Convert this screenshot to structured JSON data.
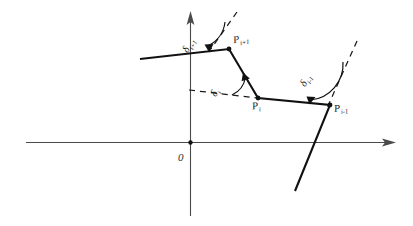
{
  "figure": {
    "background_color": "#ffffff",
    "ink_color": "#111111",
    "axis_color": "#4a4a4a",
    "origin_label": "0",
    "axes": {
      "x_axis_name": "x-axis",
      "y_axis_name": "y-axis",
      "x_arrow": "right-arrowhead",
      "y_arrow": "up-arrowhead"
    },
    "vertices": [
      {
        "id": "p-i-plus-1",
        "label_base": "P",
        "label_sub": "i+1",
        "x": 229,
        "y": 49
      },
      {
        "id": "p-i",
        "label_base": "P",
        "label_sub": "i",
        "x": 258,
        "y": 98
      },
      {
        "id": "p-i-minus-1",
        "label_base": "P",
        "label_sub": "i-1",
        "x": 330,
        "y": 105
      }
    ],
    "angles": [
      {
        "id": "delta-i-plus-1",
        "label_base": "δ",
        "label_sub": "i+1",
        "at_vertex": "p-i-plus-1"
      },
      {
        "id": "delta-i",
        "label_base": "δ",
        "label_sub": "i",
        "at_vertex": "p-i"
      },
      {
        "id": "delta-i-minus-1",
        "label_base": "δ",
        "label_sub": "i-1",
        "at_vertex": "p-i-minus-1"
      }
    ],
    "dashed_guides": [
      {
        "id": "guide-i-plus-1",
        "description": "extension of incoming segment past P_i+1"
      },
      {
        "id": "guide-i",
        "description": "horizontal extension left of P_i"
      },
      {
        "id": "guide-i-minus-1",
        "description": "extension of outgoing segment past P_i-1"
      }
    ],
    "polyline_points": "140,59 229,49 258,98 330,105 295,191"
  },
  "chart_data": {
    "type": "line",
    "title": "",
    "xlabel": "",
    "ylabel": "",
    "grid": false,
    "legend": null,
    "series": [
      {
        "name": "polyline",
        "x": [
          140,
          229,
          258,
          330,
          295
        ],
        "y": [
          59,
          49,
          98,
          105,
          191
        ],
        "point_labels": [
          "",
          "P_{i+1}",
          "P_i",
          "P_{i-1}",
          ""
        ]
      }
    ],
    "annotations": [
      {
        "text": "δ_{i+1}",
        "x": 196,
        "y": 35
      },
      {
        "text": "δ_i",
        "x": 222,
        "y": 80
      },
      {
        "text": "δ_{i-1}",
        "x": 312,
        "y": 68
      },
      {
        "text": "0",
        "x": 181,
        "y": 158
      }
    ]
  }
}
